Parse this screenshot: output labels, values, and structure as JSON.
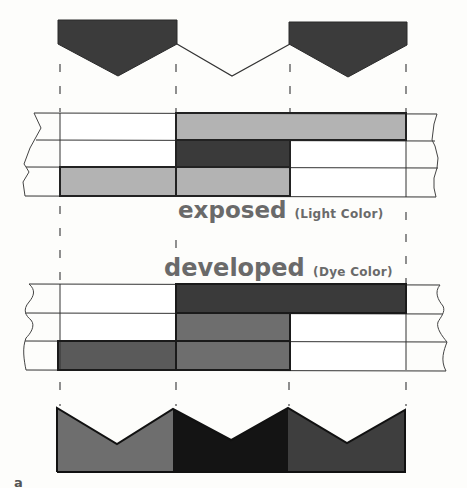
{
  "figure": {
    "letter": "a",
    "colors": {
      "background": "#fdfdfb",
      "line": "#333333",
      "light_gray": "#b3b3b3",
      "mid_gray": "#6e6e6e",
      "dark_gray": "#3a3a3a",
      "near_black": "#141414",
      "top_wave_fill": "#3b3b3b"
    },
    "columns": [
      "left",
      "middle",
      "right"
    ],
    "column_x": [
      60,
      176,
      290,
      406
    ],
    "top_waveform": {
      "description": "Input light signal: two dark filled V-shaped peaks with an open V line between them",
      "segments": [
        {
          "column": "left",
          "filled": true,
          "fill": "#3b3b3b"
        },
        {
          "column": "middle",
          "filled": false,
          "fill": "none"
        },
        {
          "column": "right",
          "filled": true,
          "fill": "#3b3b3b"
        }
      ]
    },
    "exposed": {
      "title": "exposed",
      "subtitle": "(Light Color)",
      "layers": [
        {
          "row": 1,
          "cells": [
            "#ffffff",
            "#b3b3b3",
            "#b3b3b3"
          ]
        },
        {
          "row": 2,
          "cells": [
            "#ffffff",
            "#3a3a3a",
            "#ffffff"
          ]
        },
        {
          "row": 3,
          "cells": [
            "#b3b3b3",
            "#b3b3b3",
            "#ffffff"
          ]
        }
      ]
    },
    "developed": {
      "title": "developed",
      "subtitle": "(Dye Color)",
      "layers": [
        {
          "row": 1,
          "cells": [
            "#ffffff",
            "#3a3a3a",
            "#3a3a3a"
          ]
        },
        {
          "row": 2,
          "cells": [
            "#ffffff",
            "#6e6e6e",
            "#ffffff"
          ]
        },
        {
          "row": 3,
          "cells": [
            "#5a5a5a",
            "#6e6e6e",
            "#ffffff"
          ]
        }
      ]
    },
    "bottom_waveform": {
      "description": "Resulting dye image: three filled V-notched blocks of differing density",
      "segments": [
        {
          "column": "left",
          "fill": "#6e6e6e"
        },
        {
          "column": "middle",
          "fill": "#141414"
        },
        {
          "column": "right",
          "fill": "#3e3e3e"
        }
      ]
    }
  }
}
